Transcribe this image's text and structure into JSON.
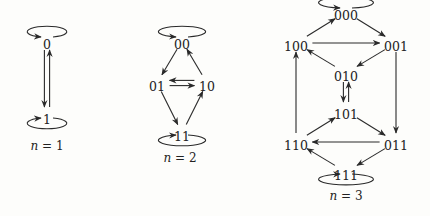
{
  "diagram": {
    "colors": {
      "stroke": "#2a2a2a",
      "text": "#222222",
      "background": "#fdfdfb"
    },
    "graphs": [
      {
        "id": "n1",
        "caption_var": "n",
        "caption_rest": " = 1",
        "nodes": [
          {
            "id": "0",
            "label": "0",
            "x": 47,
            "y": 45
          },
          {
            "id": "1",
            "label": "1",
            "x": 47,
            "y": 120
          }
        ],
        "edges": [
          {
            "from": "0",
            "to": "1"
          },
          {
            "from": "1",
            "to": "0"
          }
        ],
        "self_loops": [
          "0",
          "1"
        ],
        "caption_pos": {
          "x": 47,
          "y": 150
        }
      },
      {
        "id": "n2",
        "caption_var": "n",
        "caption_rest": " = 2",
        "nodes": [
          {
            "id": "00",
            "label": "00",
            "x": 182,
            "y": 45
          },
          {
            "id": "01",
            "label": "01",
            "x": 157,
            "y": 87
          },
          {
            "id": "10",
            "label": "10",
            "x": 207,
            "y": 87
          },
          {
            "id": "11",
            "label": "11",
            "x": 182,
            "y": 137
          }
        ],
        "edges": [
          {
            "from": "00",
            "to": "01"
          },
          {
            "from": "01",
            "to": "10"
          },
          {
            "from": "10",
            "to": "01"
          },
          {
            "from": "10",
            "to": "00"
          },
          {
            "from": "01",
            "to": "11"
          },
          {
            "from": "11",
            "to": "10"
          }
        ],
        "self_loops": [
          "00",
          "11"
        ],
        "caption_pos": {
          "x": 180,
          "y": 162
        }
      },
      {
        "id": "n3",
        "caption_var": "n",
        "caption_rest": " = 3",
        "nodes": [
          {
            "id": "000",
            "label": "000",
            "x": 346,
            "y": 16
          },
          {
            "id": "100",
            "label": "100",
            "x": 296,
            "y": 47
          },
          {
            "id": "001",
            "label": "001",
            "x": 396,
            "y": 47
          },
          {
            "id": "010",
            "label": "010",
            "x": 346,
            "y": 77
          },
          {
            "id": "101",
            "label": "101",
            "x": 346,
            "y": 115
          },
          {
            "id": "110",
            "label": "110",
            "x": 296,
            "y": 146
          },
          {
            "id": "011",
            "label": "011",
            "x": 396,
            "y": 146
          },
          {
            "id": "111",
            "label": "111",
            "x": 346,
            "y": 176
          }
        ],
        "edges": [
          {
            "from": "100",
            "to": "000"
          },
          {
            "from": "000",
            "to": "001"
          },
          {
            "from": "100",
            "to": "001"
          },
          {
            "from": "001",
            "to": "010"
          },
          {
            "from": "010",
            "to": "100"
          },
          {
            "from": "001",
            "to": "011"
          },
          {
            "from": "110",
            "to": "100"
          },
          {
            "from": "010",
            "to": "101"
          },
          {
            "from": "101",
            "to": "010"
          },
          {
            "from": "110",
            "to": "101"
          },
          {
            "from": "101",
            "to": "011"
          },
          {
            "from": "011",
            "to": "110"
          },
          {
            "from": "011",
            "to": "111"
          },
          {
            "from": "111",
            "to": "110"
          }
        ],
        "self_loops": [
          "000",
          "111"
        ],
        "caption_pos": {
          "x": 346,
          "y": 200
        }
      }
    ]
  }
}
